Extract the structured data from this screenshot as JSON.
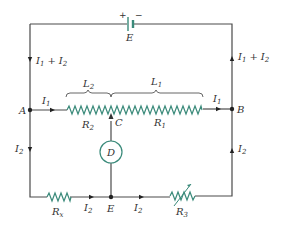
{
  "diagram": {
    "type": "Wheatstone bridge / slide-wire circuit",
    "colors": {
      "wire": "#4a4a4a",
      "resistor": "#3a8a7a",
      "text": "#333333"
    },
    "battery": {
      "symbol": "E",
      "plus": "+",
      "minus": "−"
    },
    "nodes": {
      "A": "A",
      "B": "B",
      "C": "C",
      "D": "D",
      "E": "E"
    },
    "resistors": {
      "R1": "R",
      "R1_sub": "1",
      "R2": "R",
      "R2_sub": "2",
      "R3": "R",
      "R3_sub": "3",
      "Rx": "R",
      "Rx_sub": "x"
    },
    "lengths": {
      "L1": "L",
      "L1_sub": "1",
      "L2": "L",
      "L2_sub": "2"
    },
    "currents": {
      "I": "I",
      "sub1": "1",
      "sub2": "2",
      "plus": "+"
    }
  }
}
